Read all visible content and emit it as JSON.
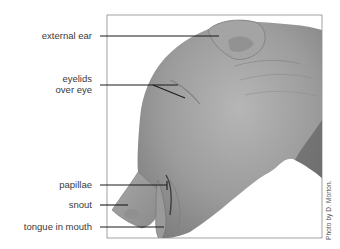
{
  "figure": {
    "frame": {
      "left": 107,
      "top": 15,
      "right": 322,
      "bottom": 238,
      "stroke": "#8a8a8a"
    },
    "colors": {
      "skin_light": "#b8b8b8",
      "skin_mid": "#9a9a9a",
      "skin_dark": "#6e6e6e",
      "leader_line": "#1a1a1a",
      "label_text": "#3a3a3a"
    }
  },
  "labels": [
    {
      "id": "external-ear",
      "text": "external ear",
      "line": {
        "x1": 100,
        "y1": 36,
        "x2": 219,
        "y2": 36
      }
    },
    {
      "id": "eyelids-over-eye",
      "text_lines": [
        "eyelids",
        "over eye"
      ],
      "line": {
        "x1": 100,
        "y1": 85,
        "x2": 153,
        "y2": 85
      },
      "branch": {
        "x1": 153,
        "y1": 85,
        "x2": 185,
        "y2": 98
      },
      "branch2": {
        "x1": 153,
        "y1": 85,
        "x2": 178,
        "y2": 85
      }
    },
    {
      "id": "papillae",
      "text": "papillae",
      "line": {
        "x1": 100,
        "y1": 185,
        "x2": 167,
        "y2": 185
      }
    },
    {
      "id": "snout",
      "text": "snout",
      "line": {
        "x1": 100,
        "y1": 205,
        "x2": 128,
        "y2": 205
      }
    },
    {
      "id": "tongue-in-mouth",
      "text": "tongue in mouth",
      "line": {
        "x1": 100,
        "y1": 227,
        "x2": 164,
        "y2": 227
      }
    }
  ],
  "credit": {
    "text": "Photo by D. Morton."
  }
}
